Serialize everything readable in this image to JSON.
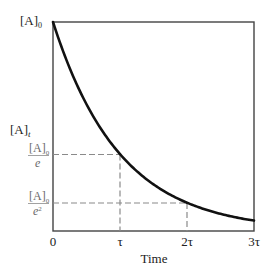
{
  "chart_data": {
    "type": "line",
    "title": "",
    "xlabel": "Time",
    "ylabel": "[A]_t",
    "x_ticks": [
      "0",
      "τ",
      "2τ",
      "3τ"
    ],
    "x_tick_values": [
      0,
      1,
      2,
      3
    ],
    "y_ticks": [
      {
        "label": "[A]_0",
        "numerator": "[A]",
        "subscript": "0",
        "value": 1.0
      },
      {
        "label": "[A]_0/e",
        "numerator": "[A]",
        "subscript": "0",
        "denominator": "e",
        "value": 0.3679
      },
      {
        "label": "[A]_0/e^2",
        "numerator": "[A]",
        "subscript": "0",
        "denominator": "e",
        "exponent": "2",
        "value": 0.1353
      }
    ],
    "xlim": [
      0,
      3
    ],
    "ylim": [
      0,
      1
    ],
    "grid": false,
    "legend": null,
    "series": [
      {
        "name": "[A]_t = [A]_0 e^(-t/τ)",
        "x": [
          0,
          0.25,
          0.5,
          0.75,
          1.0,
          1.25,
          1.5,
          1.75,
          2.0,
          2.25,
          2.5,
          2.75,
          3.0
        ],
        "values": [
          1.0,
          0.7788,
          0.6065,
          0.4724,
          0.3679,
          0.2865,
          0.2231,
          0.1738,
          0.1353,
          0.1054,
          0.0821,
          0.0639,
          0.0498
        ]
      }
    ],
    "annotations": [
      {
        "type": "dashed-guide",
        "x": 1,
        "y": 0.3679,
        "label": "[A]_0/e at τ"
      },
      {
        "type": "dashed-guide",
        "x": 2,
        "y": 0.1353,
        "label": "[A]_0/e^2 at 2τ"
      }
    ]
  },
  "labels": {
    "y_top": {
      "main": "[A]",
      "sub": "0"
    },
    "y_axis": {
      "main": "[A]",
      "sub": "t"
    },
    "y_e": {
      "num_main": "[A]",
      "num_sub": "0",
      "den": "e"
    },
    "y_e2": {
      "num_main": "[A]",
      "num_sub": "0",
      "den": "e",
      "den_sup": "2"
    },
    "x0": "0",
    "x1": "τ",
    "x2": "2τ",
    "x3": "3τ",
    "xlabel": "Time"
  },
  "colors": {
    "curve": "#111111",
    "frame": "#444444",
    "guide": "#8a8a8a",
    "text": "#222222"
  }
}
